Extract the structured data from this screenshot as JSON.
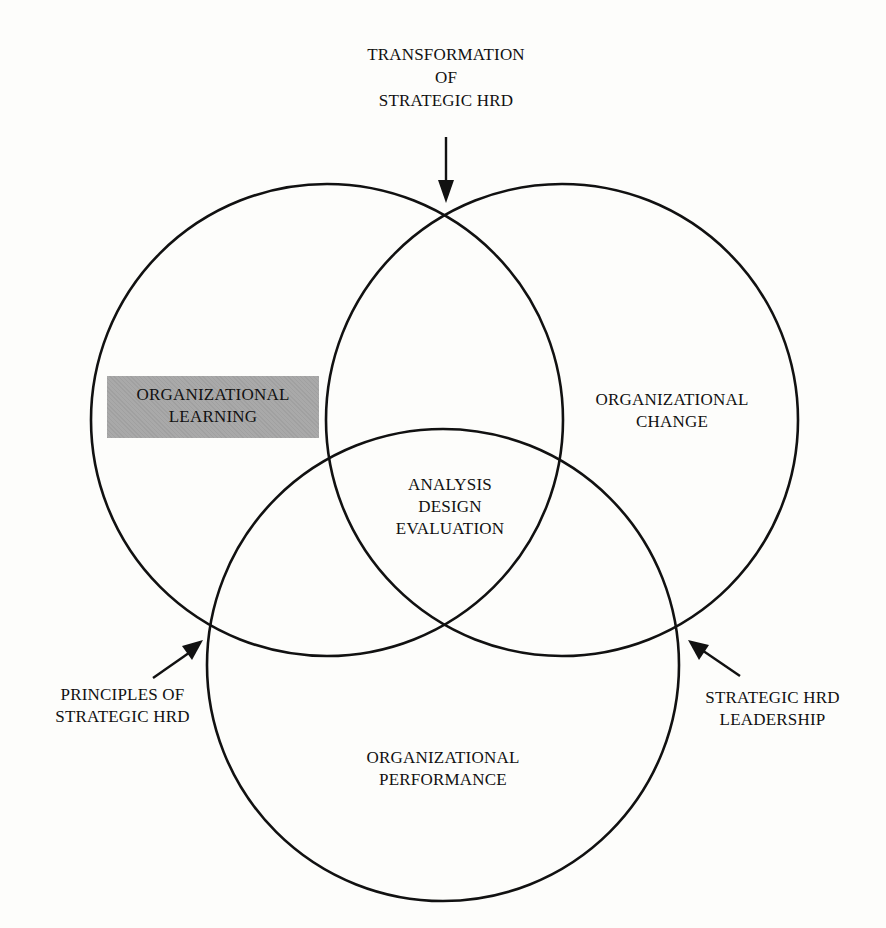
{
  "diagram": {
    "type": "venn",
    "colors": {
      "stroke": "#111111",
      "background": "#fdfdfb",
      "shaded_fill": "#a9a9a9"
    },
    "circles": [
      {
        "id": "learning",
        "cx": 327,
        "cy": 420,
        "r": 236,
        "label_lines": [
          "ORGANIZATIONAL",
          "LEARNING"
        ],
        "highlighted": true
      },
      {
        "id": "change",
        "cx": 562,
        "cy": 420,
        "r": 236,
        "label_lines": [
          "ORGANIZATIONAL",
          "CHANGE"
        ],
        "highlighted": false
      },
      {
        "id": "performance",
        "cx": 443,
        "cy": 665,
        "r": 236,
        "label_lines": [
          "ORGANIZATIONAL",
          "PERFORMANCE"
        ],
        "highlighted": false
      }
    ],
    "center": {
      "label_lines": [
        "ANALYSIS",
        "DESIGN",
        "EVALUATION"
      ]
    },
    "annotations": [
      {
        "id": "top",
        "label_lines": [
          "TRANSFORMATION",
          "OF",
          "STRATEGIC HRD"
        ],
        "points_to": "intersection of learning and change (top)"
      },
      {
        "id": "left",
        "label_lines": [
          "PRINCIPLES OF",
          "STRATEGIC HRD"
        ],
        "points_to": "intersection of learning and performance (left)"
      },
      {
        "id": "right",
        "label_lines": [
          "STRATEGIC HRD",
          "LEADERSHIP"
        ],
        "points_to": "intersection of change and performance (right)"
      }
    ]
  }
}
